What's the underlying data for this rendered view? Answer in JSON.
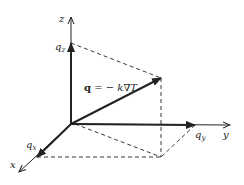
{
  "diagram": {
    "equation": {
      "bold": "q",
      "rest": " = −",
      "k": "k",
      "nabla": "∇",
      "T": "T"
    },
    "axes": {
      "x": "x",
      "y": "y",
      "z": "z"
    },
    "components": {
      "qx": {
        "base": "q",
        "sub": "x"
      },
      "qy": {
        "base": "q",
        "sub": "y"
      },
      "qz": {
        "base": "q",
        "sub": "z"
      }
    },
    "colors": {
      "line": "#222222",
      "background": "#ffffff"
    },
    "geometry": {
      "origin": [
        71,
        124
      ],
      "z_axis_end": [
        71,
        17
      ],
      "qz_point": [
        71,
        43
      ],
      "y_axis_end": [
        230,
        125
      ],
      "qy_point": [
        195,
        125
      ],
      "x_axis_end": [
        19,
        172
      ],
      "qx_point": [
        37,
        157
      ],
      "q_tip": [
        161,
        78
      ],
      "base_corner": [
        161,
        157
      ]
    }
  }
}
